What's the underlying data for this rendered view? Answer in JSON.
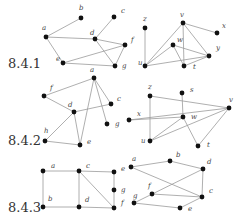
{
  "figure": {
    "sections": [
      {
        "label": "8.4.1",
        "label_pos": [
          8,
          68
        ],
        "graphs": [
          {
            "name": "graph-8-4-1-left",
            "nodes": [
              {
                "id": "a",
                "x": 46,
                "y": 37,
                "lx": 42,
                "ly": 30
              },
              {
                "id": "b",
                "x": 81,
                "y": 18,
                "lx": 79,
                "ly": 10
              },
              {
                "id": "c",
                "x": 114,
                "y": 17,
                "lx": 121,
                "ly": 13
              },
              {
                "id": "d",
                "x": 95,
                "y": 39,
                "lx": 90,
                "ly": 35
              },
              {
                "id": "e",
                "x": 63,
                "y": 63,
                "lx": 56,
                "ly": 61
              },
              {
                "id": "f",
                "x": 125,
                "y": 45,
                "lx": 131,
                "ly": 42
              },
              {
                "id": "g",
                "x": 115,
                "y": 66,
                "lx": 122,
                "ly": 68
              }
            ],
            "edges": [
              [
                "a",
                "b"
              ],
              [
                "a",
                "d"
              ],
              [
                "a",
                "e"
              ],
              [
                "d",
                "c"
              ],
              [
                "d",
                "f"
              ],
              [
                "d",
                "g"
              ],
              [
                "e",
                "f"
              ],
              [
                "e",
                "g"
              ],
              [
                "f",
                "g"
              ]
            ]
          },
          {
            "name": "graph-8-4-1-right",
            "nodes": [
              {
                "id": "z",
                "x": 145,
                "y": 28,
                "lx": 143,
                "ly": 21
              },
              {
                "id": "u",
                "x": 145,
                "y": 66,
                "lx": 138,
                "ly": 65
              },
              {
                "id": "v",
                "x": 183,
                "y": 23,
                "lx": 180,
                "ly": 17
              },
              {
                "id": "w",
                "x": 173,
                "y": 45,
                "lx": 177,
                "ly": 42
              },
              {
                "id": "x",
                "x": 217,
                "y": 33,
                "lx": 222,
                "ly": 28
              },
              {
                "id": "y",
                "x": 209,
                "y": 56,
                "lx": 216,
                "ly": 50
              },
              {
                "id": "t",
                "x": 184,
                "y": 66,
                "lx": 193,
                "ly": 69
              }
            ],
            "edges": [
              [
                "z",
                "u"
              ],
              [
                "u",
                "v"
              ],
              [
                "u",
                "w"
              ],
              [
                "u",
                "y"
              ],
              [
                "v",
                "x"
              ],
              [
                "v",
                "t"
              ],
              [
                "v",
                "y"
              ],
              [
                "w",
                "t"
              ],
              [
                "w",
                "y"
              ],
              [
                "t",
                "y"
              ]
            ]
          }
        ],
        "extra_labels": [
          {
            "text": "f",
            "x": 130,
            "y": 40
          }
        ]
      },
      {
        "label": "8.4.2",
        "label_pos": [
          8,
          145
        ],
        "graphs": [
          {
            "name": "graph-8-4-2-left",
            "nodes": [
              {
                "id": "a",
                "x": 94,
                "y": 78,
                "lx": 90,
                "ly": 72
              },
              {
                "id": "f",
                "x": 44,
                "y": 96,
                "lx": 50,
                "ly": 90
              },
              {
                "id": "c",
                "x": 111,
                "y": 104,
                "lx": 117,
                "ly": 101
              },
              {
                "id": "d",
                "x": 74,
                "y": 112,
                "lx": 68,
                "ly": 107
              },
              {
                "id": "g",
                "x": 107,
                "y": 124,
                "lx": 115,
                "ly": 126
              },
              {
                "id": "h",
                "x": 45,
                "y": 141,
                "lx": 44,
                "ly": 133
              },
              {
                "id": "e",
                "x": 80,
                "y": 145,
                "lx": 87,
                "ly": 144
              }
            ],
            "edges": [
              [
                "a",
                "f"
              ],
              [
                "f",
                "d"
              ],
              [
                "a",
                "c"
              ],
              [
                "a",
                "g"
              ],
              [
                "a",
                "e"
              ],
              [
                "d",
                "c"
              ],
              [
                "d",
                "e"
              ],
              [
                "d",
                "h"
              ],
              [
                "h",
                "e"
              ]
            ]
          },
          {
            "name": "graph-8-4-2-right",
            "nodes": [
              {
                "id": "z",
                "x": 150,
                "y": 96,
                "lx": 148,
                "ly": 89
              },
              {
                "id": "s",
                "x": 182,
                "y": 93,
                "lx": 190,
                "ly": 92
              },
              {
                "id": "v",
                "x": 229,
                "y": 108,
                "lx": 229,
                "ly": 102
              },
              {
                "id": "x",
                "x": 129,
                "y": 120,
                "lx": 137,
                "ly": 116
              },
              {
                "id": "w",
                "x": 183,
                "y": 117,
                "lx": 191,
                "ly": 119
              },
              {
                "id": "u",
                "x": 150,
                "y": 141,
                "lx": 141,
                "ly": 143
              },
              {
                "id": "t",
                "x": 198,
                "y": 146,
                "lx": 207,
                "ly": 147
              }
            ],
            "edges": [
              [
                "z",
                "u"
              ],
              [
                "z",
                "v"
              ],
              [
                "s",
                "w"
              ],
              [
                "x",
                "v"
              ],
              [
                "x",
                "w"
              ],
              [
                "w",
                "u"
              ],
              [
                "u",
                "v"
              ],
              [
                "w",
                "t"
              ],
              [
                "t",
                "v"
              ]
            ]
          }
        ],
        "extra_labels": [
          {
            "text": "g",
            "x": 116,
            "y": 127
          }
        ]
      },
      {
        "label": "8.4.3",
        "label_pos": [
          8,
          212
        ],
        "graphs": [
          {
            "name": "graph-8-4-3-left",
            "nodes": [
              {
                "id": "a",
                "x": 43,
                "y": 171,
                "lx": 51,
                "ly": 168
              },
              {
                "id": "c",
                "x": 79,
                "y": 171,
                "lx": 86,
                "ly": 168
              },
              {
                "id": "e",
                "x": 114,
                "y": 172,
                "lx": 121,
                "ly": 171
              },
              {
                "id": "g",
                "x": 114,
                "y": 190,
                "lx": 121,
                "ly": 192
              },
              {
                "id": "b",
                "x": 43,
                "y": 207,
                "lx": 48,
                "ly": 201
              },
              {
                "id": "d",
                "x": 79,
                "y": 207,
                "lx": 85,
                "ly": 202
              },
              {
                "id": "f",
                "x": 114,
                "y": 208,
                "lx": 121,
                "ly": 205
              }
            ],
            "edges": [
              [
                "a",
                "c"
              ],
              [
                "c",
                "e"
              ],
              [
                "a",
                "b"
              ],
              [
                "c",
                "d"
              ],
              [
                "e",
                "g"
              ],
              [
                "g",
                "f"
              ],
              [
                "c",
                "f"
              ],
              [
                "b",
                "d"
              ],
              [
                "d",
                "f"
              ]
            ]
          },
          {
            "name": "graph-8-4-3-right",
            "nodes": [
              {
                "id": "a",
                "x": 131,
                "y": 167,
                "lx": 132,
                "ly": 161
              },
              {
                "id": "b",
                "x": 170,
                "y": 161,
                "lx": 176,
                "ly": 157
              },
              {
                "id": "d",
                "x": 203,
                "y": 169,
                "lx": 207,
                "ly": 164
              },
              {
                "id": "f",
                "x": 152,
                "y": 194,
                "lx": 148,
                "ly": 188
              },
              {
                "id": "c",
                "x": 202,
                "y": 197,
                "lx": 209,
                "ly": 193
              },
              {
                "id": "g",
                "x": 134,
                "y": 203,
                "lx": 133,
                "ly": 198
              },
              {
                "id": "e",
                "x": 180,
                "y": 208,
                "lx": 188,
                "ly": 211
              }
            ],
            "edges": [
              [
                "a",
                "b"
              ],
              [
                "b",
                "d"
              ],
              [
                "a",
                "c"
              ],
              [
                "d",
                "c"
              ],
              [
                "d",
                "g"
              ],
              [
                "f",
                "c"
              ],
              [
                "g",
                "e"
              ],
              [
                "e",
                "c"
              ]
            ]
          }
        ],
        "extra_labels": []
      }
    ]
  },
  "style": {
    "edge_color": "#9a9a9a",
    "node_color": "#111111",
    "label_color": "#444444",
    "section_label_color": "#333333"
  }
}
